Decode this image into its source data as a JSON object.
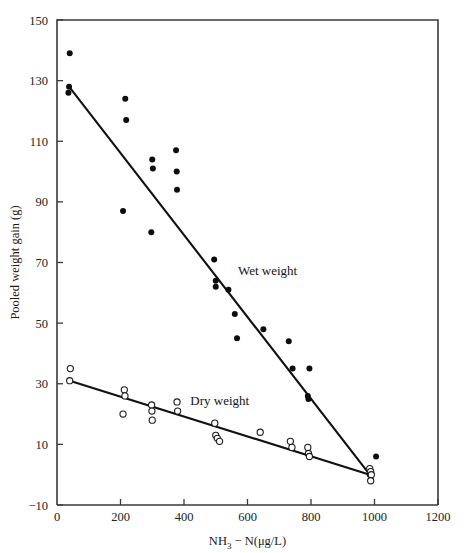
{
  "figure": {
    "background_color": "#ffffff",
    "ink_color": "#1a1a1a"
  },
  "chart_data": {
    "type": "scatter",
    "title": "",
    "subtitle": "",
    "xlabel_parts": {
      "lead": "NH",
      "sub": "3",
      "tail": " − N(μg/L)"
    },
    "xlabel": "NH3 − N(μg/L)",
    "ylabel": "Pooled weight gain (g)",
    "xlim": [
      0,
      1200
    ],
    "ylim": [
      -10,
      150
    ],
    "xticks": [
      0,
      200,
      400,
      600,
      800,
      1000,
      1200
    ],
    "xtick_labels": [
      "0",
      "200",
      "400",
      "600",
      "800",
      "1000",
      "1200"
    ],
    "yticks": [
      -10,
      10,
      30,
      50,
      70,
      90,
      110,
      130,
      150
    ],
    "ytick_labels": [
      "−10",
      "10",
      "30",
      "50",
      "70",
      "90",
      "110",
      "130",
      "150"
    ],
    "grid": false,
    "legend_position": "inline-annotations",
    "annotations": [
      {
        "text": "Wet weight",
        "x": 570,
        "y": 66,
        "name": "wet-weight-label"
      },
      {
        "text": "Dry weight",
        "x": 420,
        "y": 23,
        "name": "dry-weight-label"
      }
    ],
    "series": [
      {
        "name": "Wet weight",
        "marker": "filled-circle",
        "color": "#0d0d0d",
        "points": [
          [
            40,
            139
          ],
          [
            38,
            128
          ],
          [
            36,
            126
          ],
          [
            215,
            124
          ],
          [
            218,
            117
          ],
          [
            208,
            87
          ],
          [
            300,
            104
          ],
          [
            302,
            101
          ],
          [
            297,
            80
          ],
          [
            375,
            107
          ],
          [
            377,
            100
          ],
          [
            378,
            94
          ],
          [
            495,
            71
          ],
          [
            500,
            64
          ],
          [
            500,
            62
          ],
          [
            540,
            61
          ],
          [
            560,
            53
          ],
          [
            567,
            45
          ],
          [
            650,
            48
          ],
          [
            730,
            44
          ],
          [
            742,
            35
          ],
          [
            795,
            35
          ],
          [
            790,
            26
          ],
          [
            792,
            25
          ],
          [
            985,
            0
          ],
          [
            1005,
            6
          ]
        ]
      },
      {
        "name": "Dry weight",
        "marker": "open-circle",
        "color": "#1c1c1c",
        "points": [
          [
            42,
            35
          ],
          [
            40,
            31
          ],
          [
            212,
            28
          ],
          [
            214,
            26
          ],
          [
            208,
            20
          ],
          [
            298,
            23
          ],
          [
            299,
            21
          ],
          [
            300,
            18
          ],
          [
            378,
            24
          ],
          [
            380,
            21
          ],
          [
            497,
            17
          ],
          [
            500,
            13
          ],
          [
            505,
            12
          ],
          [
            512,
            11
          ],
          [
            640,
            14
          ],
          [
            735,
            11
          ],
          [
            740,
            9
          ],
          [
            790,
            9
          ],
          [
            792,
            7
          ],
          [
            795,
            6
          ],
          [
            985,
            2
          ],
          [
            988,
            1
          ],
          [
            990,
            0
          ],
          [
            988,
            -2
          ]
        ]
      }
    ],
    "fit_lines": [
      {
        "name": "Wet weight regression",
        "series": "Wet weight",
        "x1": 38,
        "y1": 128,
        "x2": 985,
        "y2": 0
      },
      {
        "name": "Dry weight regression",
        "series": "Dry weight",
        "x1": 40,
        "y1": 31,
        "x2": 985,
        "y2": 0
      }
    ]
  }
}
